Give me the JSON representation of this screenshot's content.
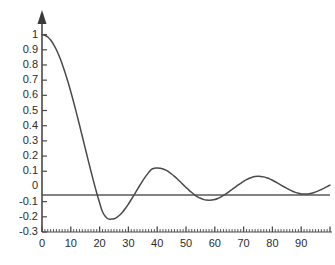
{
  "chart_data": {
    "type": "line",
    "title": "",
    "subtitle": "",
    "xlabel": "",
    "ylabel": "",
    "xlim": [
      0,
      100
    ],
    "ylim": [
      -0.3,
      1.05
    ],
    "grid": false,
    "legend": null,
    "y_ticks": [
      1,
      0.9,
      0.8,
      0.7,
      0.6,
      0.5,
      0.4,
      0.3,
      0.2,
      0.1,
      0,
      -0.1,
      -0.2,
      -0.3
    ],
    "y_tick_labels": [
      "1",
      "0.9",
      "0.8",
      "0.7",
      "0.6",
      "0.5",
      "0.4",
      "0.3",
      "0.2",
      "0.1",
      "0",
      "-0.1",
      "-0.2",
      "-0.3"
    ],
    "x_ticks": [
      0,
      10,
      20,
      30,
      40,
      50,
      60,
      70,
      80,
      90
    ],
    "x_tick_labels": [
      "0",
      "10",
      "20",
      "30",
      "40",
      "50",
      "60",
      "70",
      "80",
      "90"
    ],
    "x_minor_tick_step": 1,
    "series": [
      {
        "name": "damped-oscillation",
        "color": "#4a4a4a",
        "x": [
          0,
          1,
          2,
          3,
          4,
          5,
          6,
          7,
          8,
          9,
          10,
          11,
          12,
          13,
          14,
          15,
          16,
          17,
          18,
          19,
          20,
          21,
          22,
          23,
          24,
          25,
          26,
          27,
          28,
          29,
          30,
          31,
          32,
          33,
          34,
          35,
          36,
          37,
          38,
          39,
          40,
          41,
          42,
          43,
          44,
          45,
          46,
          47,
          48,
          49,
          50,
          51,
          52,
          53,
          54,
          55,
          56,
          57,
          58,
          59,
          60,
          61,
          62,
          63,
          64,
          65,
          66,
          67,
          68,
          69,
          70,
          71,
          72,
          73,
          74,
          75,
          76,
          77,
          78,
          79,
          80,
          81,
          82,
          83,
          84,
          85,
          86,
          87,
          88,
          89,
          90,
          91,
          92,
          93,
          94,
          95,
          96,
          97,
          98,
          99,
          100
        ],
        "y": [
          1.0,
          0.996,
          0.984,
          0.964,
          0.936,
          0.9,
          0.857,
          0.807,
          0.751,
          0.69,
          0.624,
          0.554,
          0.481,
          0.406,
          0.329,
          0.252,
          0.175,
          0.1,
          0.027,
          -0.043,
          -0.108,
          -0.167,
          -0.198,
          -0.214,
          -0.215,
          -0.213,
          -0.203,
          -0.188,
          -0.168,
          -0.144,
          -0.116,
          -0.086,
          -0.055,
          -0.023,
          0.008,
          0.038,
          0.066,
          0.091,
          0.112,
          0.12,
          0.121,
          0.12,
          0.115,
          0.107,
          0.096,
          0.082,
          0.066,
          0.049,
          0.031,
          0.012,
          -0.006,
          -0.024,
          -0.04,
          -0.055,
          -0.068,
          -0.078,
          -0.085,
          -0.09,
          -0.091,
          -0.09,
          -0.086,
          -0.079,
          -0.07,
          -0.059,
          -0.047,
          -0.034,
          -0.02,
          -0.006,
          0.008,
          0.021,
          0.034,
          0.045,
          0.054,
          0.061,
          0.065,
          0.067,
          0.066,
          0.063,
          0.057,
          0.05,
          0.041,
          0.031,
          0.02,
          0.009,
          -0.002,
          -0.013,
          -0.023,
          -0.032,
          -0.039,
          -0.045,
          -0.049,
          -0.05,
          -0.05,
          -0.047,
          -0.043,
          -0.036,
          -0.029,
          -0.02,
          -0.011,
          -0.001,
          0.009
        ],
        "peaks": [
          {
            "x": 0,
            "y": 1.0
          },
          {
            "x": 22,
            "y": -0.215
          },
          {
            "x": 38,
            "y": 0.121
          },
          {
            "x": 54,
            "y": -0.091
          },
          {
            "x": 70,
            "y": 0.067
          },
          {
            "x": 85,
            "y": -0.05
          }
        ],
        "zero_crossings": [
          15,
          30,
          46,
          62,
          78,
          94
        ]
      }
    ],
    "axis_color": "#4a4a4a",
    "zero_line": 0
  }
}
